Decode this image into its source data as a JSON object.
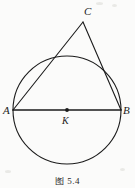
{
  "figure": {
    "caption": "图 5.4",
    "background_color": "#fbfbfa",
    "stroke_color": "#1b1b1b"
  },
  "labels": {
    "a": "A",
    "b": "B",
    "c": "C",
    "k": "K"
  },
  "chart_data": {
    "type": "diagram",
    "title": "图 5.4",
    "subtitle": "",
    "xlabel": "",
    "ylabel": "",
    "xlim": [
      0,
      135
    ],
    "ylim": [
      188,
      0
    ],
    "grid": false,
    "legend": "none",
    "shapes": [
      {
        "name": "circle",
        "kind": "circle",
        "cx": 67,
        "cy": 110,
        "r": 54,
        "stroke": "#1b1b1b",
        "stroke_width": 1.1,
        "fill": "none"
      },
      {
        "name": "diameter-ab",
        "kind": "line",
        "x1": 13,
        "y1": 110,
        "x2": 121,
        "y2": 110,
        "stroke": "#1b1b1b",
        "stroke_width": 1.6
      },
      {
        "name": "side-ac",
        "kind": "line",
        "x1": 13,
        "y1": 110,
        "x2": 83,
        "y2": 22,
        "stroke": "#1b1b1b",
        "stroke_width": 1.1
      },
      {
        "name": "side-cb",
        "kind": "line",
        "x1": 83,
        "y1": 22,
        "x2": 121,
        "y2": 110,
        "stroke": "#1b1b1b",
        "stroke_width": 1.1
      }
    ],
    "points": [
      {
        "name": "A",
        "label": "A",
        "x": 13,
        "y": 110,
        "marker": "none"
      },
      {
        "name": "B",
        "label": "B",
        "x": 121,
        "y": 110,
        "marker": "none"
      },
      {
        "name": "C",
        "label": "C",
        "x": 83,
        "y": 22,
        "marker": "none"
      },
      {
        "name": "K",
        "label": "K",
        "x": 67,
        "y": 110,
        "marker": "dot",
        "radius": 1.9
      }
    ]
  }
}
